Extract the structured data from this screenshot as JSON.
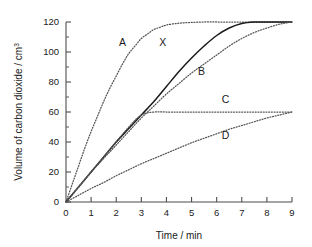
{
  "chart_data": {
    "type": "line",
    "title": "",
    "xlabel": "Time / min",
    "ylabel": "Volume of carbon dioxide / cm³",
    "ylabel_text": "Volume of carbon dioxide / cm",
    "ylabel_sup": "3",
    "xlim": [
      0,
      9
    ],
    "ylim": [
      0,
      120
    ],
    "xticks": [
      "0",
      "1",
      "2",
      "3",
      "4",
      "5",
      "6",
      "7",
      "8",
      "9"
    ],
    "yticks": [
      "0",
      "20",
      "40",
      "60",
      "80",
      "100",
      "120"
    ],
    "xtick_values": [
      0,
      1,
      2,
      3,
      4,
      5,
      6,
      7,
      8,
      9
    ],
    "ytick_values": [
      0,
      20,
      40,
      60,
      80,
      100,
      120
    ],
    "grid": false,
    "legend": "none",
    "annotations": [
      {
        "label": "A",
        "x": 2.25,
        "y": 104,
        "curve": "A"
      },
      {
        "label": "X",
        "x": 3.85,
        "y": 104,
        "curve": "X"
      },
      {
        "label": "B",
        "x": 5.4,
        "y": 85,
        "curve": "B"
      },
      {
        "label": "C",
        "x": 6.35,
        "y": 66,
        "curve": "C"
      },
      {
        "label": "D",
        "x": 6.35,
        "y": 42,
        "curve": "D"
      }
    ],
    "series": [
      {
        "name": "A",
        "style": "dotted",
        "color": "#555555",
        "plateau": 120,
        "x": [
          0,
          0.25,
          0.5,
          0.75,
          1,
          1.25,
          1.5,
          1.75,
          2,
          2.25,
          2.5,
          2.75,
          3,
          3.25,
          3.5,
          3.75,
          4,
          4.5,
          5,
          5.5,
          6,
          6.5,
          7,
          7.5,
          8,
          8.5,
          9
        ],
        "values": [
          0,
          12,
          24,
          36,
          47,
          57,
          67,
          76,
          84,
          92,
          99,
          104,
          109,
          112,
          115,
          116.5,
          118,
          119.2,
          119.7,
          120,
          120,
          120,
          120,
          120,
          120,
          120,
          120
        ]
      },
      {
        "name": "X",
        "style": "solid",
        "color": "#1a1a1a",
        "plateau": 120,
        "x": [
          0,
          0.5,
          1,
          1.5,
          2,
          2.5,
          3,
          3.5,
          4,
          4.5,
          5,
          5.5,
          6,
          6.5,
          7,
          7.5,
          8,
          8.5,
          9
        ],
        "values": [
          0,
          10,
          20,
          30,
          40,
          49,
          58,
          67,
          77,
          87,
          96,
          104,
          111,
          116,
          119,
          120,
          120,
          120,
          120
        ]
      },
      {
        "name": "B",
        "style": "dotted",
        "color": "#555555",
        "plateau": 120,
        "x": [
          0,
          0.5,
          1,
          1.5,
          2,
          2.5,
          3,
          3.5,
          4,
          4.5,
          5,
          5.5,
          6,
          6.5,
          7,
          7.5,
          8,
          8.5,
          9
        ],
        "values": [
          0,
          10,
          20,
          29,
          38,
          47,
          56,
          64,
          72,
          79,
          86,
          92,
          98,
          104,
          109,
          113,
          116,
          118.5,
          120
        ]
      },
      {
        "name": "C",
        "style": "dotted",
        "color": "#555555",
        "plateau": 60,
        "x": [
          0,
          0.5,
          1,
          1.5,
          2,
          2.5,
          3,
          3.5,
          4,
          5,
          6,
          7,
          8,
          9
        ],
        "values": [
          0,
          10,
          20,
          30,
          40,
          50,
          58,
          60,
          60,
          60,
          60,
          60,
          60,
          60
        ]
      },
      {
        "name": "D",
        "style": "dotted",
        "color": "#555555",
        "plateau": 60,
        "x": [
          0,
          0.5,
          1,
          1.5,
          2,
          2.5,
          3,
          3.5,
          4,
          4.5,
          5,
          5.5,
          6,
          6.5,
          7,
          7.5,
          8,
          8.5,
          9
        ],
        "values": [
          0,
          4.5,
          9,
          13,
          17.5,
          21.5,
          25.5,
          29,
          32.5,
          36,
          39.5,
          42.5,
          45.5,
          48.5,
          51,
          53.5,
          56,
          58,
          60
        ]
      }
    ]
  }
}
